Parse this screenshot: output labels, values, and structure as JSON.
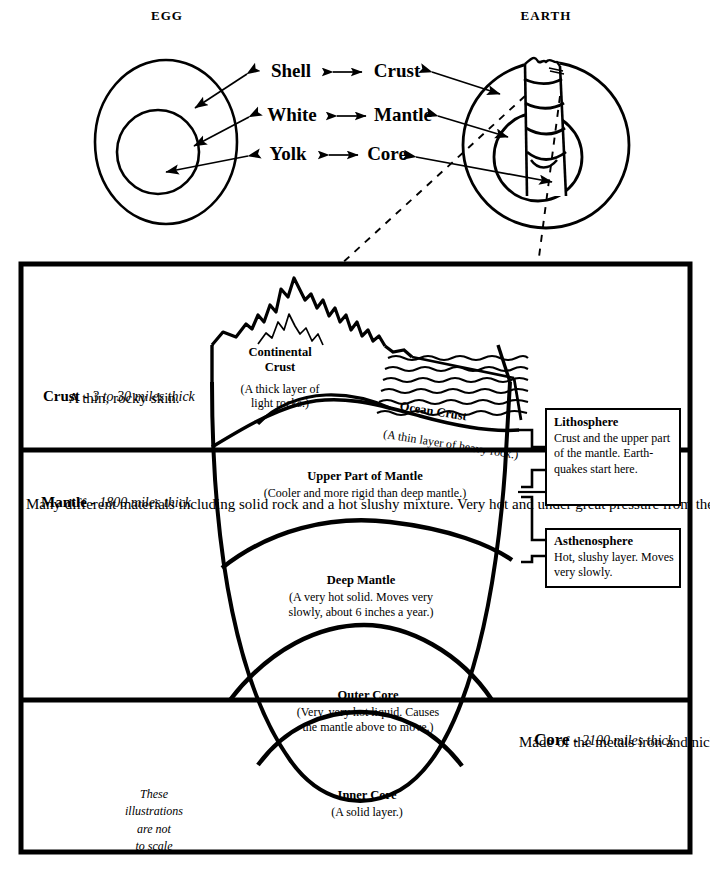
{
  "figure": {
    "title_left": "EGG",
    "title_right": "EARTH",
    "comparison_rows": [
      {
        "egg": "Shell",
        "earth": "Crust"
      },
      {
        "egg": "White",
        "earth": "Mantle"
      },
      {
        "egg": "Yolk",
        "earth": "Core"
      }
    ]
  },
  "cross_section": {
    "layers": [
      {
        "name": "Crust",
        "thickness": "3 to 30 miles thick",
        "description": "A thin, rocky skin."
      },
      {
        "name": "Mantle",
        "thickness": "1800 miles thick",
        "description": "Many different materials including solid rock and a hot slushy mixture. Very hot and under great pressure from the earth above. Moves slowly."
      },
      {
        "name": "Core",
        "thickness": "2100 miles thick",
        "description": "Made of the metals iron and nickel. Due to great pressure, materials in the center of the earth are the heaviest."
      }
    ],
    "zones": [
      {
        "name": "Continental\nCrust",
        "desc": "(A thick layer of\nlight rocks.)"
      },
      {
        "name": "Ocean Crust",
        "desc": "(A thin layer of heavy rock.)"
      },
      {
        "name": "Upper Part of Mantle",
        "desc": "(Cooler and more rigid than deep mantle.)"
      },
      {
        "name": "Deep Mantle",
        "desc": "(A very hot solid. Moves very\nslowly, about 6 inches a year.)"
      },
      {
        "name": "Outer Core",
        "desc": "(Very, very hot liquid. Causes\nthe mantle above to move.)"
      },
      {
        "name": "Inner Core",
        "desc": "(A solid layer.)"
      }
    ],
    "callout_boxes": [
      {
        "title": "Lithosphere",
        "body": "Crust and the upper part of the mantle.  Earth-quakes start here."
      },
      {
        "title": "Asthenosphere",
        "body": "Hot, slushy layer. Moves very slowly."
      }
    ],
    "scale_note": "These\nillustrations\nare not\nto scale"
  },
  "crust_line1_prefix": "Crust",
  "mantle_line1_prefix": "Mantle",
  "core_line1_prefix": "Core",
  "style": {
    "ink": "#000000",
    "paper": "#ffffff"
  }
}
